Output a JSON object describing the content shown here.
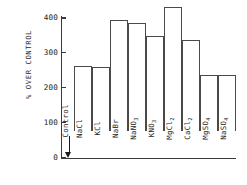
{
  "chart_data": {
    "type": "bar",
    "title": "",
    "xlabel": "",
    "ylabel": "% OVER CONTROL",
    "ylim": [
      0,
      400
    ],
    "ytick_labels": [
      "400",
      "300",
      "200",
      "100",
      "0"
    ],
    "yticks": [
      400,
      300,
      200,
      100,
      0
    ],
    "grid": false,
    "legend": null,
    "categories": [
      "NaCl",
      "KCl",
      "NaBr",
      "NaNO3",
      "KNO3",
      "MgCl2",
      "CaCl2",
      "MgSO4",
      "NaSO4"
    ],
    "values": [
      185,
      183,
      318,
      310,
      272,
      355,
      260,
      160,
      161
    ],
    "annotations": [
      {
        "name": "control-marker",
        "label": "Control",
        "value": 0,
        "arrow": "down"
      }
    ]
  },
  "axis": {
    "y_title": "% OVER CONTROL",
    "ticks": [
      {
        "label": "400",
        "value": 400
      },
      {
        "label": "300",
        "value": 300
      },
      {
        "label": "200",
        "value": 200
      },
      {
        "label": "100",
        "value": 100
      },
      {
        "label": "0",
        "value": 0
      }
    ]
  },
  "bars": [
    {
      "label_main": "NaCl",
      "label_sub": "",
      "value": 185
    },
    {
      "label_main": "KCl",
      "label_sub": "",
      "value": 183
    },
    {
      "label_main": "NaBr",
      "label_sub": "",
      "value": 318
    },
    {
      "label_main": "NaNO",
      "label_sub": "3",
      "value": 310
    },
    {
      "label_main": "KNO",
      "label_sub": "3",
      "value": 272
    },
    {
      "label_main": "MgCl",
      "label_sub": "2",
      "value": 355
    },
    {
      "label_main": "CaCl",
      "label_sub": "2",
      "value": 260
    },
    {
      "label_main": "MgSO",
      "label_sub": "4",
      "value": 160
    },
    {
      "label_main": "NaSO",
      "label_sub": "4",
      "value": 161
    }
  ],
  "control": {
    "label": "Control"
  },
  "style": {
    "bar_outline_color": "#4a4a4a",
    "bar_fill_color": "#ffffff",
    "axis_color": "#3a3a3a",
    "text_color": "#1d1d1d"
  }
}
